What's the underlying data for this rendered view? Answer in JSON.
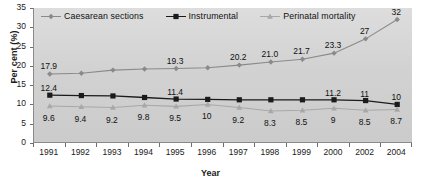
{
  "chart_data": {
    "type": "line",
    "title": "",
    "xlabel": "Year",
    "ylabel": "Per cent (%)",
    "categories": [
      "1991",
      "1992",
      "1993",
      "1994",
      "1995",
      "1996",
      "1997",
      "1998",
      "1999",
      "2000",
      "2002",
      "2004"
    ],
    "ylim": [
      0,
      35
    ],
    "yticks": [
      0,
      5,
      10,
      15,
      20,
      25,
      30,
      35
    ],
    "grid": false,
    "legend_position": "top-left-inside",
    "series": [
      {
        "name": "Caesarean sections",
        "marker": "diamond",
        "color": "#8a8a8a",
        "values": [
          17.9,
          18.1,
          18.9,
          19.2,
          19.3,
          19.5,
          20.2,
          21.0,
          21.7,
          23.3,
          27,
          32
        ],
        "labels": [
          "17.9",
          "",
          "",
          "",
          "19.3",
          "",
          "20.2",
          "21.0",
          "21.7",
          "23.3",
          "27",
          "32"
        ]
      },
      {
        "name": "Instrumental",
        "marker": "square",
        "color": "#1a1a1a",
        "values": [
          12.4,
          12.3,
          12.2,
          11.8,
          11.4,
          11.3,
          11.2,
          11.2,
          11.2,
          11.2,
          11,
          10
        ],
        "labels": [
          "12.4",
          "",
          "",
          "",
          "11.4",
          "",
          "",
          "",
          "",
          "11.2",
          "11",
          "10"
        ]
      },
      {
        "name": "Perinatal mortality",
        "marker": "triangle",
        "color": "#a8a8a8",
        "values": [
          9.6,
          9.4,
          9.2,
          9.8,
          9.5,
          10,
          9.2,
          8.3,
          8.5,
          9,
          8.5,
          8.7
        ],
        "labels": [
          "9.6",
          "9.4",
          "9.2",
          "9.8",
          "9.5",
          "10",
          "9.2",
          "8.3",
          "8.5",
          "9",
          "8.5",
          "8.7"
        ]
      }
    ]
  },
  "colors": {
    "plot_background": "#d4d4d4",
    "axis": "#8a8a8a",
    "text": "#1a1a1a"
  }
}
